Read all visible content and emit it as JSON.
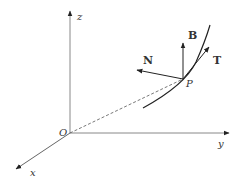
{
  "diagram": {
    "axes": {
      "z": {
        "label": "z"
      },
      "y": {
        "label": "y"
      },
      "x": {
        "label": "x"
      },
      "origin": {
        "label": "O"
      }
    },
    "point": {
      "label": "P"
    },
    "vectors": [
      {
        "label": "B",
        "meaning": "binormal"
      },
      {
        "label": "N",
        "meaning": "normal"
      },
      {
        "label": "T",
        "meaning": "tangent"
      }
    ],
    "colors": {
      "lines": "#333333",
      "axes": "#777777"
    }
  }
}
